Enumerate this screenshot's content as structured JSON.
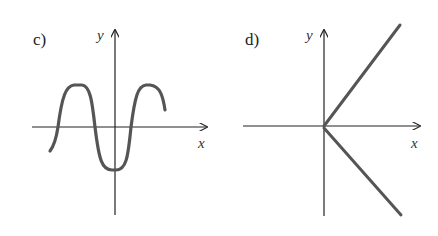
{
  "panels": [
    {
      "id": "c",
      "label": "c)",
      "x_axis_label": "x",
      "y_axis_label": "y",
      "curve": "wave: starts below axis at left, rises to a peak, falls to a minimum below the origin on the y-axis, rises to a second peak, ends slightly descending",
      "colors": {
        "axis": "#222222",
        "curve": "#555555"
      }
    },
    {
      "id": "d",
      "label": "d)",
      "x_axis_label": "x",
      "y_axis_label": "y",
      "curve": "two rays from origin: one up-right, one down-right",
      "colors": {
        "axis": "#222222",
        "curve": "#555555"
      }
    }
  ]
}
